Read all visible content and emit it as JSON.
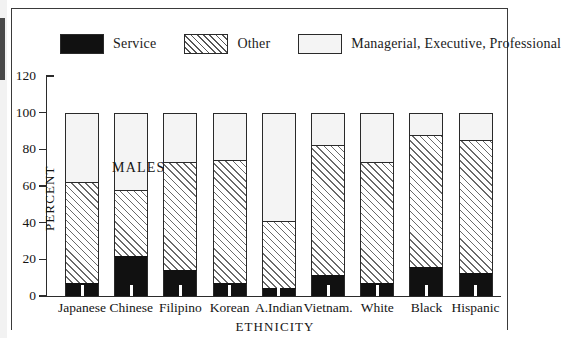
{
  "figure": {
    "annotation": "MALES"
  },
  "legend": {
    "items": [
      {
        "label": "Service",
        "swatch": "solid-black-swatch",
        "color": "#111111"
      },
      {
        "label": "Other",
        "swatch": "hatched-swatch",
        "color": "#555555"
      },
      {
        "label": "Managerial, Executive, Professional",
        "swatch": "light-grey-swatch",
        "color": "#f4f4f4"
      }
    ]
  },
  "chart_data": {
    "type": "bar",
    "title": "MALES",
    "xlabel": "ETHNICITY",
    "ylabel": "PERCENT",
    "ylim": [
      0,
      120
    ],
    "yticks": [
      0,
      20,
      40,
      60,
      80,
      100,
      120
    ],
    "ytick_labels": [
      "0",
      "20",
      "40",
      "60",
      "80",
      "100",
      "120"
    ],
    "grid": false,
    "stacked": true,
    "legend_position": "top",
    "categories": [
      "Japanese",
      "Chinese",
      "Filipino",
      "Korean",
      "A.Indian",
      "Vietnam.",
      "White",
      "Black",
      "Hispanic"
    ],
    "series": [
      {
        "name": "Service",
        "values": [
          7,
          22,
          14,
          7,
          4.5,
          11.5,
          7,
          16,
          12.5
        ]
      },
      {
        "name": "Other",
        "values": [
          55,
          36,
          59,
          67,
          36.5,
          71,
          66,
          72,
          72.5
        ]
      },
      {
        "name": "Managerial, Executive, Professional",
        "values": [
          38,
          42,
          27,
          26,
          59,
          17.5,
          27,
          12,
          15
        ]
      }
    ],
    "cumulative_tops": {
      "service": [
        7,
        22,
        14,
        7,
        4.5,
        11.5,
        7,
        16,
        12.5
      ],
      "other": [
        62,
        58,
        73,
        74,
        41,
        82.5,
        73,
        88,
        85
      ],
      "total": [
        100,
        100,
        100,
        100,
        100,
        100,
        100,
        100,
        100
      ]
    }
  }
}
